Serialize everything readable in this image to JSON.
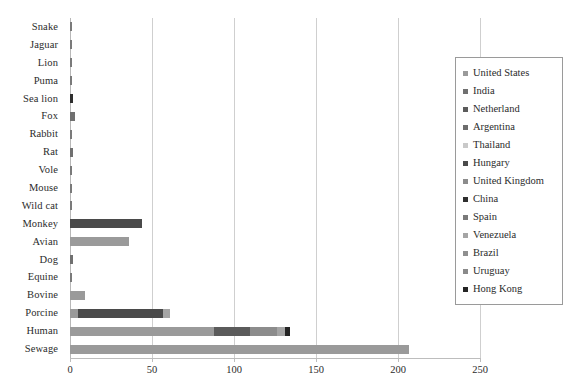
{
  "chart_data": {
    "type": "bar",
    "orientation": "horizontal",
    "stacked": true,
    "title": "",
    "xlabel": "",
    "ylabel": "",
    "xlim": [
      0,
      250
    ],
    "xticks": [
      "0",
      "50",
      "100",
      "150",
      "200",
      "250"
    ],
    "xtick_values": [
      0,
      50,
      100,
      150,
      200,
      250
    ],
    "grid": true,
    "legend_position": "right",
    "categories": [
      "Snake",
      "Jaguar",
      "Lion",
      "Puma",
      "Sea lion",
      "Fox",
      "Rabbit",
      "Rat",
      "Vole",
      "Mouse",
      "Wild cat",
      "Monkey",
      "Avian",
      "Dog",
      "Equine",
      "Bovine",
      "Porcine",
      "Human",
      "Sewage"
    ],
    "series": [
      {
        "name": "United States",
        "color": "#9a9a9a",
        "values": [
          0,
          0,
          0,
          0,
          0,
          0,
          0,
          0,
          0,
          0,
          0,
          0,
          36,
          0,
          0,
          9,
          5,
          88,
          207
        ]
      },
      {
        "name": "India",
        "color": "#707070",
        "values": [
          0,
          0,
          0,
          0,
          0,
          3,
          0,
          2,
          0,
          0,
          0,
          0,
          0,
          2,
          0,
          0,
          0,
          0,
          0
        ]
      },
      {
        "name": "Netherland",
        "color": "#5b5b5b",
        "values": [
          0,
          0,
          0,
          0,
          0,
          0,
          0,
          0,
          0,
          0,
          0,
          0,
          0,
          0,
          0,
          0,
          0,
          22,
          0
        ]
      },
      {
        "name": "Argentina",
        "color": "#6d6d6d",
        "values": [
          0,
          0,
          0,
          0,
          0,
          0,
          0,
          0,
          0,
          0,
          0,
          0,
          0,
          0,
          0,
          0,
          0,
          0,
          0
        ]
      },
      {
        "name": "Thailand",
        "color": "#c9c9c9",
        "values": [
          0,
          0,
          0,
          0,
          0,
          0,
          0,
          0,
          0,
          0,
          0,
          0,
          0,
          0,
          0,
          0,
          0,
          0,
          0
        ]
      },
      {
        "name": "Hungary",
        "color": "#4a4a4a",
        "values": [
          0,
          0,
          0,
          0,
          0,
          0,
          0,
          0,
          0,
          0,
          0,
          44,
          0,
          0,
          0,
          0,
          52,
          0,
          0
        ]
      },
      {
        "name": "United Kingdom",
        "color": "#8c8c8c",
        "values": [
          0,
          0,
          0,
          0,
          0,
          0,
          0,
          0,
          0,
          0,
          0,
          0,
          0,
          0,
          0,
          0,
          0,
          16,
          0
        ]
      },
      {
        "name": "China",
        "color": "#2e2e2e",
        "values": [
          0,
          0,
          0,
          0,
          2,
          0,
          0,
          0,
          0,
          0,
          0,
          0,
          0,
          0,
          0,
          0,
          0,
          0,
          0
        ]
      },
      {
        "name": "Spain",
        "color": "#7a7a7a",
        "values": [
          1,
          1,
          1,
          1,
          0,
          0,
          1,
          0,
          1,
          1,
          1,
          0,
          0,
          0,
          1,
          0,
          0,
          0,
          0
        ]
      },
      {
        "name": "Venezuela",
        "color": "#a5a5a5",
        "values": [
          0,
          0,
          0,
          0,
          0,
          0,
          0,
          0,
          0,
          0,
          0,
          0,
          0,
          0,
          0,
          0,
          4,
          5,
          0
        ]
      },
      {
        "name": "Brazil",
        "color": "#8f8f8f",
        "values": [
          0,
          0,
          0,
          0,
          0,
          0,
          0,
          0,
          0,
          0,
          0,
          0,
          0,
          0,
          0,
          0,
          0,
          0,
          0
        ]
      },
      {
        "name": "Uruguay",
        "color": "#8a8a8a",
        "values": [
          0,
          0,
          0,
          0,
          0,
          0,
          0,
          0,
          0,
          0,
          0,
          0,
          0,
          0,
          0,
          0,
          0,
          0,
          0
        ]
      },
      {
        "name": "Hong Kong",
        "color": "#242424",
        "values": [
          0,
          0,
          0,
          0,
          0,
          0,
          0,
          0,
          0,
          0,
          0,
          0,
          0,
          0,
          0,
          0,
          0,
          3,
          0
        ]
      }
    ],
    "totals": [
      1,
      1,
      1,
      1,
      2,
      3,
      1,
      2,
      1,
      1,
      1,
      44,
      36,
      2,
      1,
      9,
      61,
      134,
      207
    ]
  },
  "legend": {
    "items": [
      {
        "label": "United States",
        "color": "#9a9a9a"
      },
      {
        "label": "India",
        "color": "#707070"
      },
      {
        "label": "Netherland",
        "color": "#5b5b5b"
      },
      {
        "label": "Argentina",
        "color": "#6d6d6d"
      },
      {
        "label": "Thailand",
        "color": "#c9c9c9"
      },
      {
        "label": "Hungary",
        "color": "#4a4a4a"
      },
      {
        "label": "United Kingdom",
        "color": "#8c8c8c"
      },
      {
        "label": "China",
        "color": "#2e2e2e"
      },
      {
        "label": "Spain",
        "color": "#7a7a7a"
      },
      {
        "label": "Venezuela",
        "color": "#a5a5a5"
      },
      {
        "label": "Brazil",
        "color": "#8f8f8f"
      },
      {
        "label": "Uruguay",
        "color": "#8a8a8a"
      },
      {
        "label": "Hong Kong",
        "color": "#242424"
      }
    ]
  }
}
